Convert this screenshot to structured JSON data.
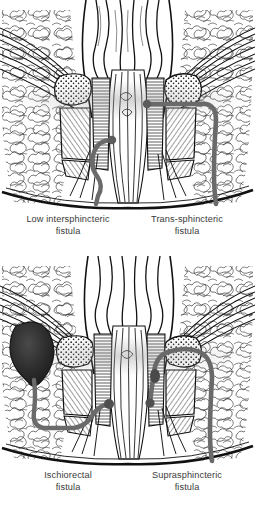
{
  "figure": {
    "style": "pen-and-ink medical illustration, coronal section of anal canal",
    "background_color": "#ffffff",
    "ink_color": "#111111",
    "tract_color": "#6a6a6a",
    "abscess_color": "#2b2b2b",
    "caption_color": "#3a3a3a"
  },
  "panels": [
    {
      "id": "panel-top",
      "name": "upper-panel",
      "captions": [
        {
          "line1": "Low intersphincteric",
          "line2": "fistula"
        },
        {
          "line1": "Trans-sphincteric",
          "line2": "fistula"
        }
      ],
      "structures": [
        "rectal mucosa folds",
        "levator ani muscle",
        "puborectalis muscle cross-section",
        "internal anal sphincter",
        "external anal sphincter",
        "ischiorectal fat",
        "perineal skin"
      ],
      "tracts": [
        {
          "name": "low-intersphincteric-tract",
          "side": "left",
          "path_note": "from anal crypt downward between internal and external sphincter to perianal skin"
        },
        {
          "name": "trans-sphincteric-tract",
          "side": "right",
          "path_note": "from anal crypt across external sphincter, laterally then down to ischiorectal fossa skin"
        }
      ]
    },
    {
      "id": "panel-bottom",
      "name": "lower-panel",
      "captions": [
        {
          "line1": "Ischiorectal",
          "line2": "fistula"
        },
        {
          "line1": "Suprasphincteric",
          "line2": "fistula"
        }
      ],
      "structures": [
        "rectal mucosa folds",
        "levator ani muscle",
        "puborectalis muscle cross-section",
        "internal anal sphincter",
        "external anal sphincter",
        "ischiorectal fossa abscess",
        "perineal skin"
      ],
      "tracts": [
        {
          "name": "ischiorectal-tract",
          "side": "left",
          "path_note": "from anal crypt laterally through external sphincter into a large ischiorectal abscess cavity"
        },
        {
          "name": "suprasphincteric-tract",
          "side": "right",
          "path_note": "from anal crypt upward over puborectalis then down through ischiorectal fossa to skin"
        }
      ],
      "abscess": {
        "name": "ischiorectal-abscess",
        "shape": "teardrop cavity",
        "fill": "#2b2b2b"
      }
    }
  ]
}
